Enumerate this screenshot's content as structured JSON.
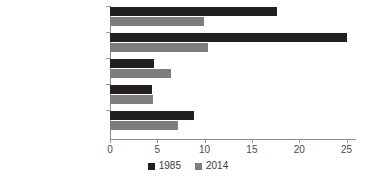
{
  "chart_data": {
    "type": "bar",
    "orientation": "horizontal",
    "title": "",
    "xlabel": "",
    "ylabel": "",
    "xlim": [
      0,
      26
    ],
    "grid": false,
    "legend_position": "bottom",
    "categories": [
      "'Old' OECD countries",
      "Former Soviet sphere",
      "Developing countries",
      "Developing w/o China",
      "World total"
    ],
    "series": [
      {
        "name": "1985",
        "color": "#231f20",
        "values": [
          17.6,
          25.0,
          4.7,
          4.4,
          8.9
        ]
      },
      {
        "name": "2014",
        "color": "#7d7d7d",
        "values": [
          9.9,
          10.4,
          6.4,
          4.5,
          7.2
        ]
      }
    ],
    "xticks": [
      0,
      5,
      10,
      15,
      20,
      25
    ],
    "xtick_labels": [
      "0",
      "5",
      "10",
      "15",
      "20",
      "25"
    ]
  },
  "legend": {
    "items": [
      {
        "label": "1985",
        "color": "#231f20"
      },
      {
        "label": "2014",
        "color": "#7d7d7d"
      }
    ]
  }
}
